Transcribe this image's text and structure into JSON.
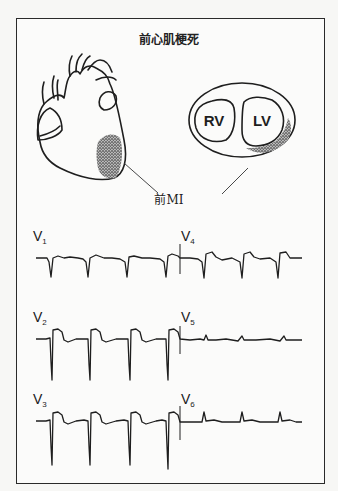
{
  "title": "前心肌梗死",
  "caption": "前MI",
  "illustrations": {
    "heart": {
      "label": "anterior heart view",
      "infarct_region": "anterior-apical left ventricle (stippled)"
    },
    "cross_section": {
      "chambers": [
        "RV",
        "LV"
      ],
      "infarct_region": "anterior LV wall (stippled)"
    }
  },
  "ecg": {
    "rows": [
      {
        "left_lead": {
          "name": "V",
          "sub": "1"
        },
        "right_lead": {
          "name": "V",
          "sub": "4"
        },
        "left_pattern": "QS complexes, mild ST elevation",
        "right_pattern": "QS/Q waves, ST elevation, T inversion"
      },
      {
        "left_lead": {
          "name": "V",
          "sub": "2"
        },
        "right_lead": {
          "name": "V",
          "sub": "5"
        },
        "left_pattern": "deep QS, marked ST elevation",
        "right_pattern": "small complexes"
      },
      {
        "left_lead": {
          "name": "V",
          "sub": "3"
        },
        "right_lead": {
          "name": "V",
          "sub": "6"
        },
        "left_pattern": "deep QS, marked ST elevation",
        "right_pattern": "small R waves"
      }
    ]
  },
  "colors": {
    "ink": "#1e1e1e",
    "paper": "#fbfbfa",
    "background": "#f7f7f5"
  }
}
